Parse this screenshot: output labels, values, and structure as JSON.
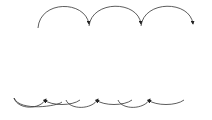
{
  "diagram": {
    "type": "gop-frame-structure",
    "frames": [
      {
        "label": "I",
        "fill": "#8a8a8a"
      },
      {
        "label": "B",
        "fill": "#b4b4b4"
      },
      {
        "label": "B",
        "fill": "#b4b4b4"
      },
      {
        "label": "P",
        "fill": "#e4e4e4"
      },
      {
        "label": "B",
        "fill": "#b4b4b4"
      },
      {
        "label": "B",
        "fill": "#b4b4b4"
      },
      {
        "label": "P",
        "fill": "#e4e4e4"
      },
      {
        "label": "B",
        "fill": "#b4b4b4"
      },
      {
        "label": "B",
        "fill": "#b4b4b4"
      },
      {
        "label": "P",
        "fill": "#ececec"
      }
    ],
    "forward_arrows": [
      {
        "from": 0,
        "to": 3
      },
      {
        "from": 3,
        "to": 6
      },
      {
        "from": 6,
        "to": 9
      }
    ],
    "bidirectional_arrows": [
      {
        "ref": 0,
        "to": 1
      },
      {
        "ref": 0,
        "to": 2
      },
      {
        "ref": 3,
        "to": 1
      },
      {
        "ref": 3,
        "to": 2
      },
      {
        "ref": 3,
        "to": 4
      },
      {
        "ref": 3,
        "to": 5
      },
      {
        "ref": 6,
        "to": 4
      },
      {
        "ref": 6,
        "to": 5
      },
      {
        "ref": 6,
        "to": 7
      },
      {
        "ref": 6,
        "to": 8
      },
      {
        "ref": 9,
        "to": 7
      },
      {
        "ref": 9,
        "to": 8
      }
    ],
    "colors": {
      "stroke": "#222222",
      "background": "#ffffff"
    }
  }
}
